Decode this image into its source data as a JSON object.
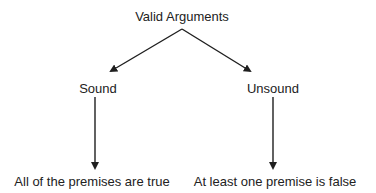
{
  "diagram": {
    "root": {
      "label": "Valid Arguments",
      "x": 182,
      "y": 9
    },
    "branches": [
      {
        "label": "Sound",
        "x": 98,
        "y": 81,
        "outcome": {
          "label": "All of the premises are true",
          "x": 92,
          "y": 174
        }
      },
      {
        "label": "Unsound",
        "x": 273,
        "y": 81,
        "outcome": {
          "label": "At least one premise is false",
          "x": 275,
          "y": 174
        }
      }
    ],
    "colors": {
      "line": "#1f1f1f",
      "text": "#222222",
      "background": "#ffffff"
    }
  }
}
